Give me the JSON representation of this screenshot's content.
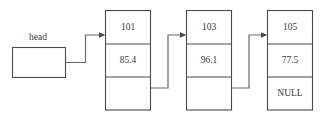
{
  "diagram": {
    "background_color": "#ffffff",
    "line_color": "#4a4a4a",
    "text_color": "#3a3a3a",
    "head": {
      "label": "head",
      "box_value": ""
    },
    "nodes": [
      {
        "key": "101",
        "value": "85.4",
        "next": ""
      },
      {
        "key": "103",
        "value": "96.1",
        "next": ""
      },
      {
        "key": "105",
        "value": "77.5",
        "next": "NULL"
      }
    ]
  }
}
